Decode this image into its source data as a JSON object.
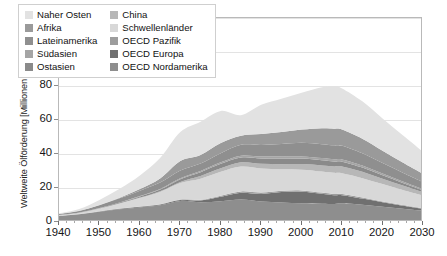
{
  "chart_data": {
    "type": "area",
    "stacked": true,
    "title": "",
    "xlabel": "",
    "ylabel": "Weltweite Ölförderung [Millionen Barrel pro Tag]",
    "xlim": [
      1940,
      2030
    ],
    "ylim": [
      0,
      120
    ],
    "xticks": [
      1940,
      1950,
      1960,
      1970,
      1980,
      1990,
      2000,
      2010,
      2020,
      2030
    ],
    "yticks": [
      0,
      20,
      40,
      60,
      80,
      100,
      120
    ],
    "xtick_labels": [
      "1940",
      "1950",
      "1960",
      "1970",
      "1980",
      "1990",
      "2000",
      "2010",
      "2020",
      "2030"
    ],
    "ytick_labels": [
      "0",
      "20",
      "40",
      "60",
      "80",
      "100",
      "120"
    ],
    "grid": true,
    "grid_axis": "y",
    "legend_position": "top-left",
    "x": [
      1940,
      1945,
      1950,
      1955,
      1960,
      1965,
      1970,
      1975,
      1980,
      1985,
      1990,
      1995,
      2000,
      2005,
      2008,
      2010,
      2015,
      2020,
      2025,
      2030
    ],
    "series": [
      {
        "name": "OECD Nordamerika",
        "color": "#8e8e8e",
        "values": [
          3.5,
          4.5,
          6.0,
          7.5,
          8.6,
          9.8,
          12.4,
          11.6,
          12.2,
          13.2,
          12.0,
          11.4,
          11.0,
          10.8,
          10.6,
          11.0,
          10.2,
          9.0,
          7.8,
          6.6
        ]
      },
      {
        "name": "OECD Europa",
        "color": "#707070",
        "values": [
          0.1,
          0.1,
          0.2,
          0.3,
          0.4,
          0.5,
          0.6,
          1.0,
          2.6,
          4.0,
          4.5,
          6.2,
          6.8,
          5.8,
          5.2,
          4.8,
          3.6,
          2.6,
          1.8,
          1.2
        ]
      },
      {
        "name": "OECD Pazifik",
        "color": "#9d9d9d",
        "values": [
          0.05,
          0.05,
          0.1,
          0.1,
          0.15,
          0.2,
          0.3,
          0.5,
          0.7,
          0.8,
          0.8,
          0.8,
          0.8,
          0.7,
          0.7,
          0.7,
          0.6,
          0.5,
          0.4,
          0.3
        ]
      },
      {
        "name": "Schwellenländer",
        "color": "#d8d8d8",
        "values": [
          0.4,
          0.8,
          1.6,
          3.0,
          5.0,
          7.2,
          9.6,
          12.4,
          14.0,
          14.6,
          14.2,
          12.6,
          12.2,
          12.4,
          12.4,
          12.2,
          11.4,
          10.2,
          8.8,
          7.4
        ]
      },
      {
        "name": "China",
        "color": "#b7b7b7",
        "values": [
          0.02,
          0.03,
          0.05,
          0.1,
          0.2,
          0.4,
          0.7,
          1.6,
          2.1,
          2.5,
          2.8,
          3.0,
          3.3,
          3.6,
          3.8,
          4.0,
          3.8,
          3.2,
          2.6,
          2.0
        ]
      },
      {
        "name": "Ostasien",
        "color": "#8a8a8a",
        "values": [
          0.1,
          0.1,
          0.2,
          0.4,
          0.7,
          1.0,
          1.6,
          2.2,
          2.6,
          2.8,
          3.0,
          3.2,
          3.2,
          3.0,
          2.9,
          2.8,
          2.4,
          2.0,
          1.6,
          1.2
        ]
      },
      {
        "name": "Südasien",
        "color": "#a5a5a5",
        "values": [
          0.02,
          0.03,
          0.05,
          0.1,
          0.2,
          0.3,
          0.5,
          0.7,
          0.9,
          1.1,
          1.2,
          1.3,
          1.3,
          1.3,
          1.3,
          1.3,
          1.2,
          1.0,
          0.8,
          0.6
        ]
      },
      {
        "name": "Lateinamerika",
        "color": "#8f8f8f",
        "values": [
          0.5,
          0.9,
          1.6,
          2.4,
          3.2,
          3.8,
          4.6,
          4.4,
          5.4,
          6.4,
          6.8,
          7.4,
          8.0,
          8.2,
          8.2,
          8.0,
          7.2,
          6.2,
          5.2,
          4.2
        ]
      },
      {
        "name": "Afrika",
        "color": "#9a9a9a",
        "values": [
          0.05,
          0.1,
          0.2,
          0.4,
          0.9,
          2.4,
          5.6,
          5.0,
          6.0,
          5.4,
          6.4,
          7.0,
          7.8,
          9.4,
          9.8,
          9.6,
          8.6,
          7.2,
          6.0,
          4.8
        ]
      },
      {
        "name": "Naher Osten",
        "color": "#e2e2e2",
        "values": [
          0.3,
          1.0,
          3.0,
          5.2,
          8.0,
          12.0,
          17.0,
          19.6,
          18.8,
          12.0,
          17.2,
          19.6,
          21.6,
          24.0,
          25.0,
          24.2,
          22.0,
          19.0,
          16.0,
          13.0
        ]
      }
    ],
    "totals": [
      5.04,
      7.61,
      13.0,
      19.5,
      27.35,
      37.6,
      52.9,
      59.0,
      65.3,
      62.8,
      68.9,
      72.5,
      76.0,
      79.2,
      79.9,
      78.6,
      71.0,
      60.9,
      51.0,
      41.3
    ],
    "peak": {
      "year": 2008,
      "value": 80
    }
  },
  "axis": {
    "y_title": "Weltweite Ölförderung [Millionen Barrel pro Tag]"
  },
  "legend": {
    "left_column": [
      {
        "label": "Naher Osten",
        "color": "#e2e2e2"
      },
      {
        "label": "Afrika",
        "color": "#9a9a9a"
      },
      {
        "label": "Lateinamerika",
        "color": "#8f8f8f"
      },
      {
        "label": "Südasien",
        "color": "#a5a5a5"
      },
      {
        "label": "Ostasien",
        "color": "#8a8a8a"
      }
    ],
    "right_column": [
      {
        "label": "China",
        "color": "#b7b7b7"
      },
      {
        "label": "Schwellenländer",
        "color": "#d8d8d8"
      },
      {
        "label": "OECD Pazifik",
        "color": "#9d9d9d"
      },
      {
        "label": "OECD Europa",
        "color": "#707070"
      },
      {
        "label": "OECD Nordamerika",
        "color": "#8e8e8e"
      }
    ]
  }
}
